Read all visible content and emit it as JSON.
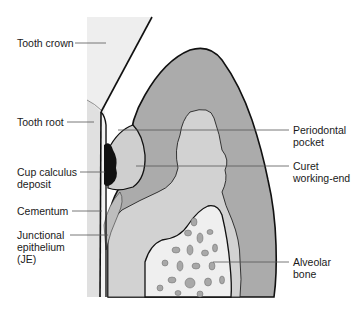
{
  "figure": {
    "colors": {
      "background": "#ffffff",
      "tooth_area": "#eeeeee",
      "root_area": "#e2e2e2",
      "gingiva_outer": "#aaaaaa",
      "gingiva_inner": "#c9c9c9",
      "connective_tissue": "#d4d4d4",
      "bone_fill": "#eeeeee",
      "bone_spots": "#a8a8a8",
      "calculus": "#111111",
      "outline": "#111111",
      "leader": "#555555"
    },
    "labels": {
      "tooth_crown": "Tooth crown",
      "tooth_root": "Tooth root",
      "cup_calculus": "Cup calculus\ndeposit",
      "cementum": "Cementum",
      "junctional_epithelium": "Junctional\nepithelium\n(JE)",
      "periodontal_pocket": "Periodontal\npocket",
      "curet_working_end": "Curet\nworking-end",
      "alveolar_bone": "Alveolar\nbone"
    }
  }
}
